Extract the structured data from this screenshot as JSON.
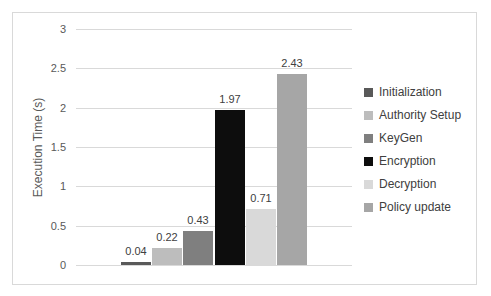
{
  "chart_data": {
    "type": "bar",
    "title": "",
    "xlabel": "",
    "ylabel": "Execution Time (s)",
    "ylim": [
      0,
      3
    ],
    "ytick_step": 0.5,
    "yticks": [
      "3",
      "2.5",
      "2",
      "1.5",
      "1",
      "0.5",
      "0"
    ],
    "grid": true,
    "legend_position": "right",
    "series": [
      {
        "name": "Initialization",
        "value": 0.04,
        "label": "0.04",
        "color": "#595959"
      },
      {
        "name": "Authority Setup",
        "value": 0.22,
        "label": "0.22",
        "color": "#bdbdbd"
      },
      {
        "name": "KeyGen",
        "value": 0.43,
        "label": "0.43",
        "color": "#7f7f7f"
      },
      {
        "name": "Encryption",
        "value": 1.97,
        "label": "1.97",
        "color": "#0d0d0d"
      },
      {
        "name": "Decryption",
        "value": 0.71,
        "label": "0.71",
        "color": "#d9d9d9"
      },
      {
        "name": "Policy update",
        "value": 2.43,
        "label": "2.43",
        "color": "#a6a6a6"
      }
    ],
    "colors": {
      "background": "#ffffff",
      "frame_border": "#d9d9d9",
      "gridline": "#d9d9d9",
      "tick_text": "#595959",
      "axis_title_text": "#595959",
      "bar_label_text": "#404040",
      "legend_text": "#404040"
    }
  }
}
